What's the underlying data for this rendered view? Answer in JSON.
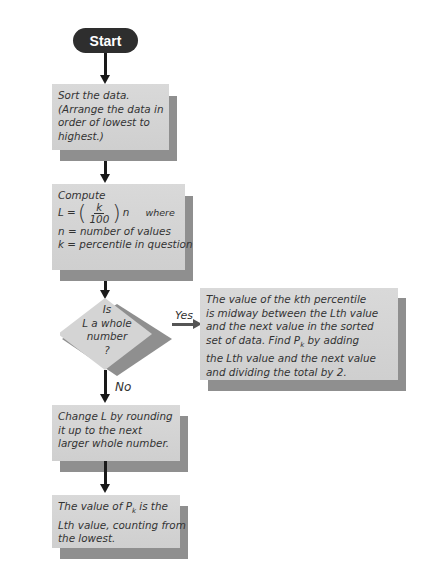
{
  "flowchart": {
    "start": {
      "label": "Start"
    },
    "step_sort": {
      "lines": [
        "Sort the data.",
        "(Arrange the data in",
        "order of lowest to",
        "highest.)"
      ]
    },
    "step_compute": {
      "title": "Compute",
      "formula_lhs": "L =",
      "fraction_num": "k",
      "fraction_den": "100",
      "formula_rhs": "n",
      "where": "where",
      "def_n": "n = number of values",
      "def_k": "k = percentile in question"
    },
    "decision": {
      "lines": [
        "Is",
        "L a whole",
        "number",
        "?"
      ]
    },
    "yes_branch": {
      "label": "Yes",
      "lines": [
        "The value of the kth percentile",
        "is midway between the Lth value",
        "and the next value in the sorted",
        "set of data. Find P",
        "the Lth value and the next value",
        "and dividing the total by 2."
      ],
      "line4_sub": "k",
      "line4_rest": " by adding"
    },
    "no_branch": {
      "label": "No"
    },
    "step_round": {
      "lines": [
        "Change L by rounding",
        "it up to the next",
        "larger whole number."
      ]
    },
    "step_result": {
      "line1_pre": "The value of P",
      "line1_sub": "k",
      "line1_post": " is the",
      "lines_rest": [
        "Lth value, counting from",
        "the lowest."
      ]
    },
    "colors": {
      "box_fill": "#d4d4d4",
      "box_shadow": "#8f8f8f",
      "start_fill": "#2e2e2e",
      "arrow": "#1a1a1a",
      "yes_arrow": "#555555"
    }
  }
}
